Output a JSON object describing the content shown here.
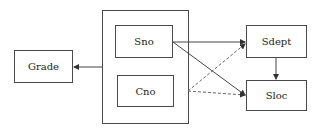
{
  "diagram": {
    "type": "functional-dependency",
    "nodes": {
      "grade": "Grade",
      "sno": "Sno",
      "cno": "Cno",
      "sdept": "Sdept",
      "sloc": "Sloc"
    },
    "group": {
      "members": [
        "Sno",
        "Cno"
      ]
    },
    "edges": [
      {
        "from": "Sno+Cno",
        "to": "Grade",
        "style": "solid"
      },
      {
        "from": "Sno",
        "to": "Sdept",
        "style": "solid"
      },
      {
        "from": "Sno",
        "to": "Sloc",
        "style": "solid"
      },
      {
        "from": "Cno",
        "to": "Sdept",
        "style": "dashed"
      },
      {
        "from": "Cno",
        "to": "Sloc",
        "style": "dashed"
      },
      {
        "from": "Sdept",
        "to": "Sloc",
        "style": "solid"
      }
    ]
  }
}
